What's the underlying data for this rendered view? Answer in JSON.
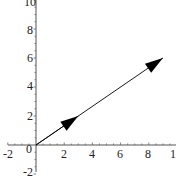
{
  "chart_data": {
    "type": "line",
    "title": "",
    "xlabel": "",
    "ylabel": "",
    "xlim": [
      -2,
      10
    ],
    "ylim": [
      -2,
      10
    ],
    "grid": false,
    "x_ticks": [
      "-2",
      "2",
      "4",
      "6",
      "8",
      "10"
    ],
    "y_ticks": [
      "10",
      "8",
      "6",
      "4",
      "2",
      "-2"
    ],
    "origin_label": "0",
    "series": [
      {
        "name": "vector-1",
        "x": [
          0,
          3
        ],
        "y": [
          0,
          2
        ],
        "arrow": true
      },
      {
        "name": "vector-2",
        "x": [
          0,
          9
        ],
        "y": [
          0,
          6
        ],
        "arrow": true
      }
    ],
    "colors": {
      "line": "#000000",
      "axis": "#555555"
    }
  }
}
